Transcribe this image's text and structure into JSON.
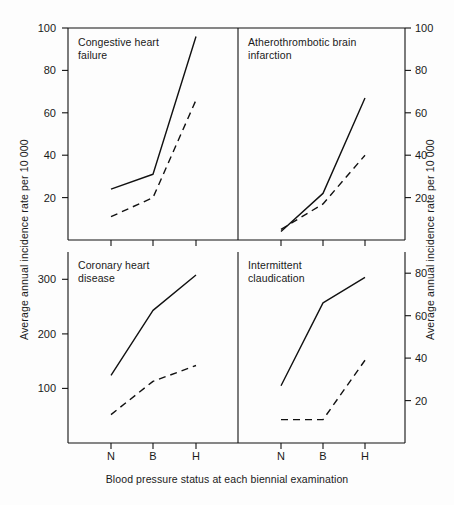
{
  "figure": {
    "xlabel": "Blood pressure status at each biennial examination",
    "ylabel_left": "Average annual incidence rate per 10 000",
    "ylabel_right": "Average annual incidence rate per 10 000",
    "line_color": "#111111"
  },
  "chart_data": {
    "type": "line",
    "title": "",
    "xlabel": "Blood pressure status at each biennial examination",
    "ylabel": "Average annual incidence rate per 10 000",
    "categories": [
      "N",
      "B",
      "H"
    ],
    "category_meanings": [
      "Normotensive",
      "Borderline",
      "Hypertensive"
    ],
    "grid": false,
    "legend": "none",
    "panels": [
      {
        "id": "congestive-heart-failure",
        "title": "Congestive heart\nfailure",
        "position": "top-left",
        "axis_side": "left",
        "ylim": [
          0,
          100
        ],
        "yticks": [
          20,
          40,
          60,
          80,
          100
        ],
        "series": [
          {
            "name": "solid",
            "style": "solid",
            "values": [
              24,
              31,
              96
            ]
          },
          {
            "name": "dashed",
            "style": "dashed",
            "values": [
              11,
              20,
              66
            ]
          }
        ]
      },
      {
        "id": "atherothrombotic-brain-infarction",
        "title": "Atherothrombotic brain\ninfarction",
        "position": "top-right",
        "axis_side": "right",
        "ylim": [
          0,
          100
        ],
        "yticks": [
          20,
          40,
          60,
          80,
          100
        ],
        "series": [
          {
            "name": "solid",
            "style": "solid",
            "values": [
              4,
              22,
              67
            ]
          },
          {
            "name": "dashed",
            "style": "dashed",
            "values": [
              5,
              17,
              40
            ]
          }
        ]
      },
      {
        "id": "coronary-heart-disease",
        "title": "Coronary heart\ndisease",
        "position": "bottom-left",
        "axis_side": "left",
        "ylim": [
          0,
          350
        ],
        "yticks": [
          100,
          200,
          300
        ],
        "series": [
          {
            "name": "solid",
            "style": "solid",
            "values": [
              124,
              243,
              308
            ]
          },
          {
            "name": "dashed",
            "style": "dashed",
            "values": [
              52,
              113,
              142
            ]
          }
        ]
      },
      {
        "id": "intermittent-claudication",
        "title": "Intermittent\nclaudication",
        "position": "bottom-right",
        "axis_side": "right",
        "ylim": [
          0,
          90
        ],
        "yticks": [
          20,
          40,
          60,
          80
        ],
        "series": [
          {
            "name": "solid",
            "style": "solid",
            "values": [
              27,
              66,
              78
            ]
          },
          {
            "name": "dashed",
            "style": "dashed",
            "values": [
              11,
              11,
              39
            ]
          }
        ]
      }
    ]
  },
  "ticks": {
    "top_left": [
      "100",
      "80",
      "60",
      "40",
      "20"
    ],
    "top_right": [
      "100",
      "80",
      "60",
      "40",
      "20"
    ],
    "bottom_left": [
      "300",
      "200",
      "100"
    ],
    "bottom_right": [
      "80",
      "60",
      "40",
      "20"
    ],
    "x": [
      "N",
      "B",
      "H",
      "N",
      "B",
      "H"
    ]
  }
}
